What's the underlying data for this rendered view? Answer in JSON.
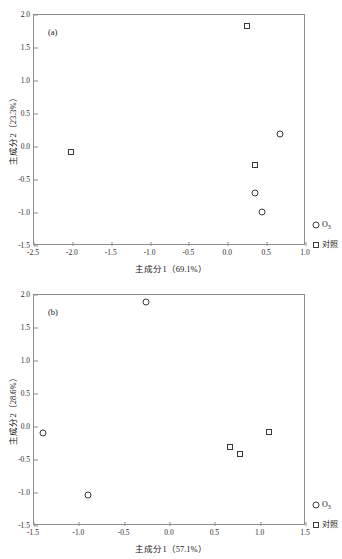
{
  "figure": {
    "background": "#ffffff",
    "marker_color": "#3a3a3a",
    "axis_color": "#8c8c8c"
  },
  "legend": {
    "ozone_label": "O",
    "ozone_sub": "3",
    "control_label": "对照",
    "ozone_marker": "circle-marker",
    "control_marker": "square-marker"
  },
  "chart_data": [
    {
      "type": "scatter",
      "panel": "(a)",
      "title": "",
      "xlabel": "主成分1（69.1%）",
      "ylabel": "主成分2（23.3%）",
      "xlim": [
        -2.5,
        1.0
      ],
      "ylim": [
        -1.5,
        2.0
      ],
      "xticks": [
        -2.5,
        -2.0,
        -1.5,
        -1.0,
        -0.5,
        0.0,
        0.5,
        1.0
      ],
      "xticklabels": [
        "-2.5",
        "-2.0",
        "-1.5",
        "-1.0",
        "-0.5",
        "0.0",
        "0.5",
        "1.0"
      ],
      "yticks": [
        -1.5,
        -1.0,
        -0.5,
        0.0,
        0.5,
        1.0,
        1.5,
        2.0
      ],
      "yticklabels": [
        "-1.5",
        "-1.0",
        "-0.5",
        "0.0",
        "0.5",
        "1.0",
        "1.5",
        "2.0"
      ],
      "grid": false,
      "legend_position": "outside-right-bottom",
      "series": [
        {
          "name": "O3",
          "marker": "circle",
          "points": [
            {
              "x": 0.66,
              "y": 0.19
            },
            {
              "x": 0.35,
              "y": -0.69
            },
            {
              "x": 0.44,
              "y": -0.99
            }
          ]
        },
        {
          "name": "对照",
          "marker": "square",
          "points": [
            {
              "x": 0.24,
              "y": 1.84
            },
            {
              "x": -2.02,
              "y": -0.08
            },
            {
              "x": 0.35,
              "y": -0.27
            }
          ]
        }
      ]
    },
    {
      "type": "scatter",
      "panel": "(b)",
      "title": "",
      "xlabel": "主成分1（57.1%）",
      "ylabel": "主成分2（28.6%）",
      "xlim": [
        -1.5,
        1.5
      ],
      "ylim": [
        -1.5,
        2.0
      ],
      "xticks": [
        -1.5,
        -1.0,
        -0.5,
        0.0,
        0.5,
        1.0,
        1.5
      ],
      "xticklabels": [
        "-1.5",
        "-1.0",
        "-0.5",
        "0.0",
        "0.5",
        "1.0",
        "1.5"
      ],
      "yticks": [
        -1.5,
        -1.0,
        -0.5,
        0.0,
        0.5,
        1.0,
        1.5,
        2.0
      ],
      "yticklabels": [
        "-1.5",
        "-1.0",
        "-0.5",
        "0.0",
        "0.5",
        "1.0",
        "1.5",
        "2.0"
      ],
      "grid": false,
      "legend_position": "outside-right-bottom",
      "series": [
        {
          "name": "O3",
          "marker": "circle",
          "points": [
            {
              "x": -0.26,
              "y": 1.9
            },
            {
              "x": -1.4,
              "y": -0.09
            },
            {
              "x": -0.9,
              "y": -1.03
            }
          ]
        },
        {
          "name": "对照",
          "marker": "square",
          "points": [
            {
              "x": 1.09,
              "y": -0.08
            },
            {
              "x": 0.66,
              "y": -0.31
            },
            {
              "x": 0.77,
              "y": -0.41
            }
          ]
        }
      ]
    }
  ]
}
